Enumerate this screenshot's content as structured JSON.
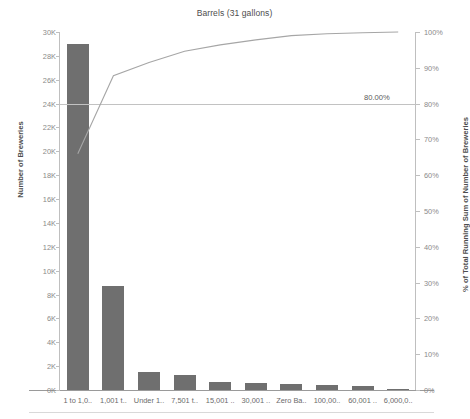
{
  "chart_data": {
    "type": "bar",
    "title": "Barrels (31 gallons)",
    "xlabel": "",
    "ylabel": "Number of Breweries",
    "y2label": "% of Total Running Sum of Number of Breweries",
    "grid": false,
    "legend_position": "none",
    "ylim": [
      0,
      30000
    ],
    "y2lim": [
      0,
      1.0
    ],
    "yticks": [
      "0K",
      "2K",
      "4K",
      "6K",
      "8K",
      "10K",
      "12K",
      "14K",
      "16K",
      "18K",
      "20K",
      "22K",
      "24K",
      "26K",
      "28K",
      "30K"
    ],
    "ytick_values": [
      0,
      2000,
      4000,
      6000,
      8000,
      10000,
      12000,
      14000,
      16000,
      18000,
      20000,
      22000,
      24000,
      26000,
      28000,
      30000
    ],
    "y2ticks": [
      "0%",
      "10%",
      "20%",
      "30%",
      "40%",
      "50%",
      "60%",
      "70%",
      "80%",
      "90%",
      "100%"
    ],
    "y2tick_values": [
      0,
      10,
      20,
      30,
      40,
      50,
      60,
      70,
      80,
      90,
      100
    ],
    "categories": [
      "1 to 1,0..",
      "1,001 t..",
      "Under 1..",
      "7,501 t..",
      "15,001 ..",
      "30,001 ..",
      "Zero Ba..",
      "100,00..",
      "60,001 ..",
      "6,000,0.."
    ],
    "series": [
      {
        "name": "Number of Breweries",
        "type": "bar",
        "axis": "left",
        "color": "#6f6f6f",
        "values": [
          29000,
          8700,
          1500,
          1250,
          700,
          560,
          470,
          420,
          300,
          90
        ]
      },
      {
        "name": "% of Total Running Sum of Number of Breweries",
        "type": "line",
        "axis": "right",
        "color": "#a6a6a6",
        "values": [
          66.0,
          87.8,
          91.5,
          94.6,
          96.4,
          97.8,
          99.0,
          99.5,
          99.8,
          100.0
        ]
      }
    ],
    "reference_line": {
      "label": "80.00%",
      "value": 80,
      "axis": "right",
      "color": "#c2c2c2"
    }
  },
  "colors": {
    "bar": "#6f6f6f",
    "line": "#a6a6a6",
    "reference": "#c2c2c2",
    "axis": "#bfbfbf",
    "text": "#6a6a6a",
    "background": "#ffffff"
  }
}
